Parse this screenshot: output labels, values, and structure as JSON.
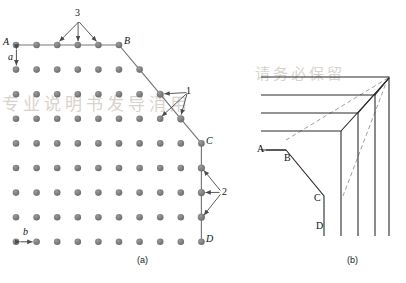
{
  "figure": {
    "type": "crystal-surface-lattice-diagram",
    "panels": [
      {
        "id": "a",
        "caption": "(a)"
      },
      {
        "id": "b",
        "caption": "(b)"
      }
    ]
  },
  "panel_a": {
    "caption": "(a)",
    "lattice": {
      "atom_color": "#7d7d80",
      "atom_radius": 3.1,
      "dx": 20.6,
      "dy": 24.6,
      "origin_x": 16,
      "origin_y": 45,
      "columns_per_row": [
        6,
        7,
        8,
        9,
        9,
        9,
        9,
        10
      ],
      "rows": 8
    },
    "boundary": {
      "color": "#6f6f72",
      "segments": [
        {
          "name": "A-B",
          "orientation": "horizontal"
        },
        {
          "name": "B-C",
          "orientation": "diagonal"
        },
        {
          "name": "C-D",
          "orientation": "vertical"
        }
      ]
    },
    "corner_labels": [
      {
        "id": "A",
        "text": "A",
        "style": "italic"
      },
      {
        "id": "B",
        "text": "B",
        "style": "italic"
      },
      {
        "id": "C",
        "text": "C",
        "style": "italic"
      },
      {
        "id": "D",
        "text": "D",
        "style": "italic"
      }
    ],
    "site_annotations": [
      {
        "id": "3",
        "text": "3",
        "arrows": 3,
        "position": "top-edge",
        "description": "terrace/ledge sites on close-packed A-B edge"
      },
      {
        "id": "1",
        "text": "1",
        "arrows": 3,
        "position": "B-C-diagonal",
        "description": "kink sites on stepped B-C diagonal"
      },
      {
        "id": "2",
        "text": "2",
        "arrows": 3,
        "position": "C-D-vertical",
        "description": "sites on vertical C-D edge"
      }
    ],
    "lattice_constants": [
      {
        "id": "a",
        "text": "a",
        "direction": "vertical",
        "description": "vertical lattice spacing"
      },
      {
        "id": "b",
        "text": "b",
        "direction": "horizontal",
        "description": "horizontal lattice spacing"
      }
    ]
  },
  "panel_b": {
    "caption": "(b)",
    "line_color": "#2b2b2b",
    "dashed_color": "#8a8a8a",
    "labels": [
      {
        "id": "A",
        "text": "A"
      },
      {
        "id": "B",
        "text": "B"
      },
      {
        "id": "C",
        "text": "C"
      },
      {
        "id": "D",
        "text": "D"
      }
    ],
    "description": "nested growth-front corner contours with dashed diagonals converging on the crystal corner"
  },
  "watermark": {
    "line1": "专业说明书发导消用",
    "line2": "请务必保留"
  }
}
